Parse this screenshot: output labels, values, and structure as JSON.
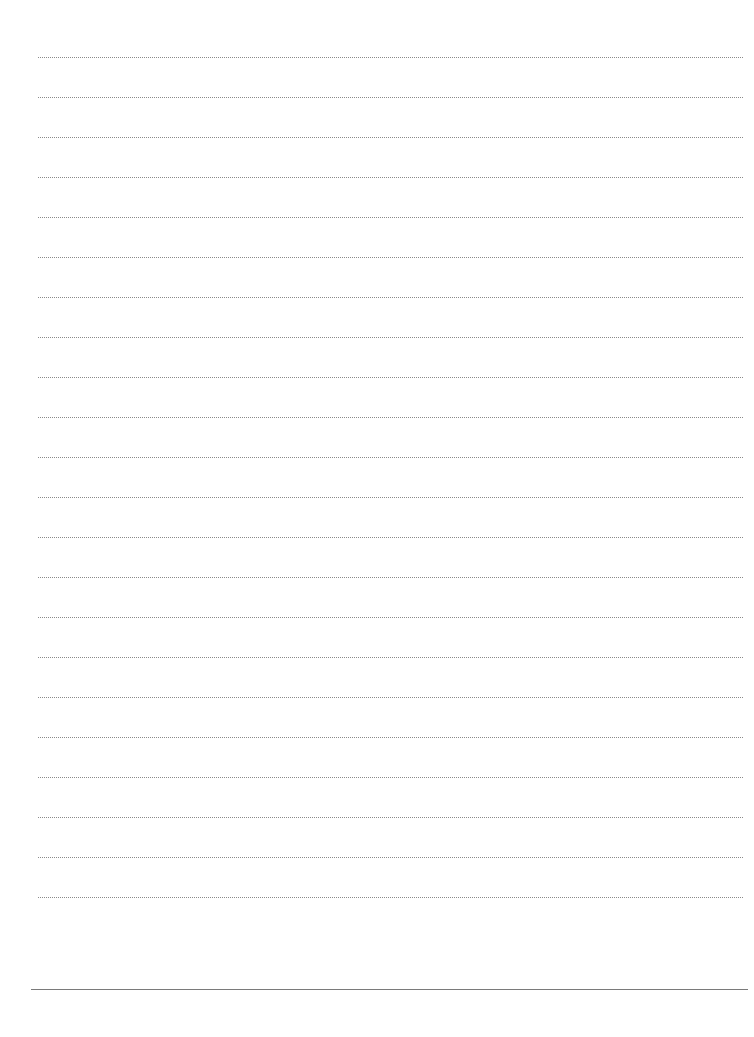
{
  "page": {
    "type": "lined-writing-sheet",
    "background_color": "#ffffff",
    "ruled_lines": {
      "count": 22,
      "style": "dotted",
      "color": "#8a8a8a",
      "first_y": 57,
      "spacing": 40,
      "x_start": 38,
      "x_end": 743
    },
    "footer_line": {
      "style": "solid",
      "color": "#7a7a7a",
      "y": 989,
      "x_start": 31,
      "x_end": 748
    }
  }
}
